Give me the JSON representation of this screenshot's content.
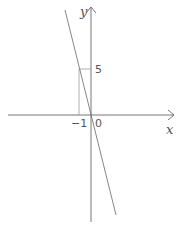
{
  "diagram": {
    "type": "coordinate-graph",
    "axes": {
      "x_label": "x",
      "y_label": "y"
    },
    "origin_label": "0",
    "tick_labels": {
      "x": "−1",
      "y": "5"
    },
    "line": {
      "description": "line through origin and (-1, 5)",
      "slope": -5,
      "intercept": 0
    },
    "marked_point": {
      "x": -1,
      "y": 5
    },
    "colors": {
      "axes": "#666666",
      "line": "#777777",
      "guides": "#999999"
    }
  }
}
